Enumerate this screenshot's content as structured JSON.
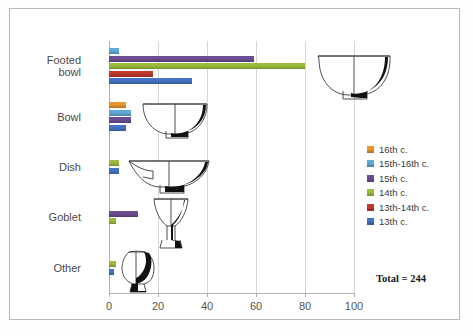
{
  "chart_data": {
    "type": "bar",
    "orientation": "horizontal",
    "title": "",
    "xlabel": "",
    "ylabel": "",
    "xlim": [
      0,
      100
    ],
    "xticks": [
      0,
      20,
      40,
      60,
      80,
      100
    ],
    "grid": true,
    "legend_position": "right",
    "categories": [
      "Footed bowl",
      "Bowl",
      "Dish",
      "Goblet",
      "Other"
    ],
    "series": [
      {
        "name": "16th c.",
        "color": "#E8952E",
        "values": [
          0,
          7,
          0,
          0,
          0
        ]
      },
      {
        "name": "15th-16th c.",
        "color": "#5FA9D4",
        "values": [
          4,
          9,
          0,
          0,
          0
        ]
      },
      {
        "name": "15th c.",
        "color": "#6B4E93",
        "values": [
          59,
          9,
          0,
          12,
          0
        ]
      },
      {
        "name": "14th c.",
        "color": "#9BBB3B",
        "values": [
          80,
          0,
          4,
          3,
          3
        ]
      },
      {
        "name": "13th-14th c.",
        "color": "#C0392B",
        "values": [
          18,
          0,
          0,
          0,
          0
        ]
      },
      {
        "name": "13th c.",
        "color": "#4472C4",
        "values": [
          34,
          7,
          4,
          0,
          2
        ]
      }
    ],
    "annotations": [
      {
        "name": "total-label",
        "text": "Total = 244"
      }
    ]
  },
  "axis": {
    "x_tick_labels": [
      "0",
      "20",
      "40",
      "60",
      "80",
      "100"
    ],
    "y_category_labels": [
      {
        "line1": "Footed",
        "line2": "bowl"
      },
      {
        "line1": "Bowl",
        "line2": ""
      },
      {
        "line1": "Dish",
        "line2": ""
      },
      {
        "line1": "Goblet",
        "line2": ""
      },
      {
        "line1": "Other",
        "line2": ""
      }
    ]
  },
  "legend": {
    "entries": [
      {
        "label": "16th c.",
        "color": "#E8952E"
      },
      {
        "label": "15th-16th c.",
        "color": "#5FA9D4"
      },
      {
        "label": "15th c.",
        "color": "#6B4E93"
      },
      {
        "label": "14th c.",
        "color": "#9BBB3B"
      },
      {
        "label": "13th-14th c.",
        "color": "#C0392B"
      },
      {
        "label": "13th c.",
        "color": "#4472C4"
      }
    ]
  },
  "total": {
    "text": "Total = 244"
  },
  "illustrations": [
    {
      "name": "footed-bowl-profile-drawing"
    },
    {
      "name": "bowl-profile-drawing"
    },
    {
      "name": "dish-profile-drawing"
    },
    {
      "name": "goblet-profile-drawing"
    },
    {
      "name": "other-vessel-profile-drawing"
    }
  ]
}
